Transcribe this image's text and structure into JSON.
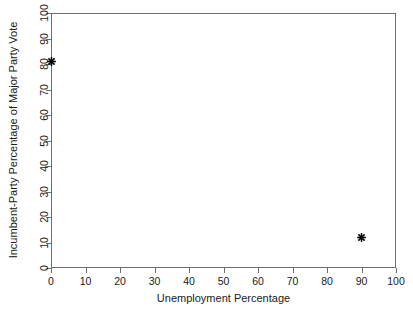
{
  "chart_data": {
    "type": "scatter",
    "title": "",
    "xlabel": "Unemployment Percentage",
    "ylabel": "Incumbent-Party Percentage of Major Party Vote",
    "xlim": [
      0,
      100
    ],
    "ylim": [
      0,
      100
    ],
    "xticks": [
      0,
      10,
      20,
      30,
      40,
      50,
      60,
      70,
      80,
      90,
      100
    ],
    "yticks": [
      0,
      10,
      20,
      30,
      40,
      50,
      60,
      70,
      80,
      90,
      100
    ],
    "xtick_labels": [
      "0",
      "10",
      "20",
      "30",
      "40",
      "50",
      "60",
      "70",
      "80",
      "90",
      "100"
    ],
    "ytick_labels": [
      "0",
      "10",
      "20",
      "30",
      "40",
      "50",
      "60",
      "70",
      "80",
      "90",
      "100"
    ],
    "grid": false,
    "legend": false,
    "marker": "asterisk",
    "marker_color": "#000000",
    "frame_color": "#6e6e6e",
    "background": "#ffffff",
    "points": [
      {
        "x": 0,
        "y": 81,
        "label": "point-1"
      },
      {
        "x": 90,
        "y": 12,
        "label": "point-2"
      }
    ]
  },
  "figure": {
    "axis_title_x": "Unemployment Percentage",
    "axis_title_y": "Incumbent-Party Percentage of Major Party Vote"
  }
}
